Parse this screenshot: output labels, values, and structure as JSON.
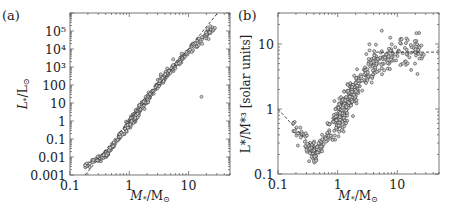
{
  "chart_data": [
    {
      "panel": "(a)",
      "type": "scatter",
      "xlabel": "M*/M⊙",
      "ylabel": "L*/L⊙",
      "xscale": "log",
      "yscale": "log",
      "xlim": [
        0.1,
        50
      ],
      "ylim": [
        0.001,
        1000000
      ],
      "xticks": [
        0.1,
        1,
        10
      ],
      "xtick_labels": [
        "0.1",
        "1",
        "10"
      ],
      "yticks": [
        0.001,
        0.01,
        0.1,
        1,
        10,
        100,
        1000,
        10000,
        100000
      ],
      "ytick_labels": [
        "0.001",
        "0.01",
        "0.1",
        "1",
        "10",
        "100",
        "10³",
        "10⁴",
        "10⁵"
      ],
      "grid": false,
      "reference_line": {
        "style": "dashed",
        "description": "L ∝ M^4",
        "points": [
          [
            0.18,
            0.001
          ],
          [
            31,
            1000000
          ]
        ]
      },
      "series_description": "Tight mass–luminosity relation; ~500 stars from M≈0.18 to M≈30, L≈0.003 to L≈3×10^5; one outlier near M≈16, L≈20",
      "sample_points": [
        [
          0.18,
          0.004
        ],
        [
          0.22,
          0.006
        ],
        [
          0.25,
          0.008
        ],
        [
          0.3,
          0.011
        ],
        [
          0.35,
          0.014
        ],
        [
          0.4,
          0.02
        ],
        [
          0.45,
          0.028
        ],
        [
          0.5,
          0.04
        ],
        [
          0.55,
          0.06
        ],
        [
          0.6,
          0.09
        ],
        [
          0.7,
          0.18
        ],
        [
          0.8,
          0.35
        ],
        [
          0.9,
          0.6
        ],
        [
          1.0,
          1.0
        ],
        [
          1.1,
          1.6
        ],
        [
          1.2,
          2.3
        ],
        [
          1.3,
          3.2
        ],
        [
          1.4,
          4.8
        ],
        [
          1.5,
          6.5
        ],
        [
          1.6,
          8
        ],
        [
          1.8,
          13
        ],
        [
          2.0,
          22
        ],
        [
          2.2,
          35
        ],
        [
          2.5,
          55
        ],
        [
          2.8,
          90
        ],
        [
          3.2,
          150
        ],
        [
          3.7,
          280
        ],
        [
          4.3,
          450
        ],
        [
          5,
          800
        ],
        [
          6,
          1400
        ],
        [
          7,
          2200
        ],
        [
          8,
          3200
        ],
        [
          10,
          5500
        ],
        [
          12,
          9000
        ],
        [
          15,
          15000
        ],
        [
          18,
          30000
        ],
        [
          20,
          50000
        ],
        [
          25,
          90000
        ],
        [
          30,
          200000
        ],
        [
          16,
          22
        ]
      ]
    },
    {
      "panel": "(b)",
      "type": "scatter",
      "xlabel": "M*/M⊙",
      "ylabel": "L*/M*³ [solar units]",
      "xscale": "log",
      "yscale": "log",
      "xlim": [
        0.1,
        50
      ],
      "ylim": [
        0.1,
        30
      ],
      "xticks": [
        0.1,
        1,
        10
      ],
      "xtick_labels": [
        "0.1",
        "1",
        "10"
      ],
      "yticks": [
        0.1,
        1,
        10
      ],
      "ytick_labels": [
        "0.1",
        "1",
        "10"
      ],
      "grid": false,
      "reference_lines": [
        {
          "style": "dashed",
          "description": "low-mass decline ∝ M^-1",
          "points": [
            [
              0.1,
              1.0
            ],
            [
              0.45,
              0.22
            ]
          ]
        },
        {
          "style": "dashed",
          "description": "high-mass plateau",
          "points": [
            [
              4.4,
              7.5
            ],
            [
              50,
              7.5
            ]
          ]
        }
      ],
      "series_description": "L/M^3 vs mass: declines from ~1 at 0.1 to minimum ~0.2 at ~0.45, rises steeply to ~5 by M≈3, plateaus around 5–12 for M>4",
      "sample_points": [
        [
          0.15,
          0.6
        ],
        [
          0.2,
          0.45
        ],
        [
          0.25,
          0.35
        ],
        [
          0.3,
          0.3
        ],
        [
          0.35,
          0.27
        ],
        [
          0.4,
          0.22
        ],
        [
          0.45,
          0.2
        ],
        [
          0.5,
          0.25
        ],
        [
          0.55,
          0.3
        ],
        [
          0.6,
          0.35
        ],
        [
          0.7,
          0.5
        ],
        [
          0.8,
          0.7
        ],
        [
          0.9,
          0.9
        ],
        [
          1.0,
          1.1
        ],
        [
          1.1,
          1.3
        ],
        [
          1.2,
          1.6
        ],
        [
          1.3,
          1.8
        ],
        [
          1.5,
          2.2
        ],
        [
          1.7,
          2.8
        ],
        [
          2.0,
          3.5
        ],
        [
          2.3,
          4.0
        ],
        [
          2.7,
          4.5
        ],
        [
          3.2,
          5.5
        ],
        [
          4,
          6.5
        ],
        [
          5,
          7
        ],
        [
          5.5,
          16
        ],
        [
          6,
          8
        ],
        [
          8,
          7.5
        ],
        [
          10,
          9
        ],
        [
          12,
          10
        ],
        [
          15,
          8
        ],
        [
          17,
          4
        ],
        [
          20,
          7
        ],
        [
          30,
          8
        ],
        [
          40,
          7.5
        ]
      ]
    }
  ],
  "panels": {
    "a": {
      "label": "(a)",
      "xlabel_main": "M",
      "xlabel_sub": "*",
      "xlabel_rest": "/M",
      "xlabel_sun": "⊙",
      "ylabel_main": "L",
      "ylabel_sub": "*",
      "ylabel_rest": "/L",
      "ylabel_sun": "⊙"
    },
    "b": {
      "label": "(b)",
      "xlabel_main": "M",
      "xlabel_sub": "*",
      "xlabel_rest": "/M",
      "xlabel_sun": "⊙",
      "ylabel_text": "L*/M*³ [solar units]"
    }
  }
}
